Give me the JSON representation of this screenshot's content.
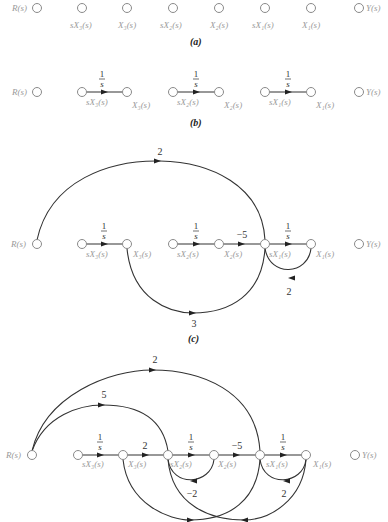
{
  "figure": {
    "node_labels": {
      "R": "R(s)",
      "Y": "Y(s)",
      "sX3": "sX₃(s)",
      "X3": "X₃(s)",
      "sX2": "sX₂(s)",
      "X2": "X₂(s)",
      "sX1": "sX₁(s)",
      "X1": "X₁(s)"
    },
    "integrator_gain": {
      "num": "1",
      "den": "s"
    },
    "panels": {
      "a": {
        "caption": "(a)"
      },
      "b": {
        "caption": "(b)"
      },
      "c": {
        "caption": "(c)",
        "gains": {
          "r_to_sx1": "2",
          "x2_to_sx1": "−5",
          "x1_to_sx1": "2",
          "x3_to_sx1": "3"
        }
      },
      "d": {
        "gains": {
          "r_to_sx1": "2",
          "r_to_sx2": "5",
          "x3_to_sx2": "2",
          "x2_to_sx1": "−5",
          "x2_to_sx2": "−2",
          "x1_to_sx1": "2"
        }
      }
    }
  }
}
